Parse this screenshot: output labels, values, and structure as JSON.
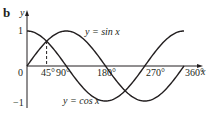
{
  "panel_label": "b",
  "chart_data": {
    "type": "line",
    "title": "",
    "xlabel": "x",
    "ylabel": "y",
    "xlim": [
      0,
      360
    ],
    "ylim": [
      -1,
      1
    ],
    "grid": false,
    "x_ticks": [
      "0",
      "45°",
      "90°",
      "180°",
      "270°",
      "360°"
    ],
    "y_ticks": [
      "1",
      "0",
      "−1"
    ],
    "series": [
      {
        "name": "y = sin x",
        "x": [
          0,
          90,
          180,
          270,
          360
        ],
        "values": [
          0,
          1,
          0,
          -1,
          0
        ]
      },
      {
        "name": "y = cos x",
        "x": [
          0,
          90,
          180,
          270,
          360
        ],
        "values": [
          1,
          0,
          -1,
          0,
          1
        ]
      }
    ],
    "annotations": [
      {
        "type": "dashed-vertical",
        "x": 45,
        "note": "intersection of sin x and cos x at 45°"
      }
    ]
  },
  "labels": {
    "y_axis": "y",
    "x_axis": "x",
    "tick_0": "0",
    "tick_45": "45°",
    "tick_90": "90°",
    "tick_180": "180°",
    "tick_270": "270°",
    "tick_360": "360°",
    "tick_1": "1",
    "tick_neg1": "−1",
    "sin_label": "y = sin x",
    "cos_label": "y = cos x"
  },
  "colors": {
    "ink": "#231f20",
    "background": "#ffffff"
  }
}
